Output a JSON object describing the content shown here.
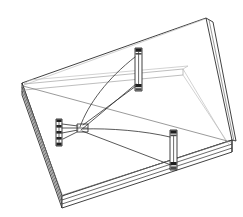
{
  "figure": {
    "title": "Isometric wireframe line drawing of a rectangular base plate with three vertical posts and connecting strings",
    "type": "technical-line-drawing",
    "background_color": "#ffffff",
    "canvas": {
      "width": 243,
      "height": 217
    },
    "colors": {
      "outline_dark": "#2b2b2b",
      "outline_mid": "#6e6e6e",
      "outline_light": "#9a9a9a",
      "outline_faint": "#b4b4b4",
      "post_fill": "#ffffff",
      "post_band": "#1f1f1f",
      "face_fill": "#ffffff"
    },
    "parts": [
      {
        "name": "base-plate",
        "label": "Base plate",
        "description": "Large tilted rectangular slab drawn in perspective with visible edge thickness along the left and bottom sides",
        "corners": {
          "left": [
            22,
            83
          ],
          "top": [
            206,
            18
          ],
          "right": [
            232,
            140
          ],
          "bottom": [
            62,
            196
          ]
        },
        "thickness_px": 12
      },
      {
        "name": "inner-frame",
        "label": "Inner frame rail",
        "description": "Lighter secondary rail offset inside the plate running from the left corner to the right corner",
        "stroke_color": "#9a9a9a"
      },
      {
        "name": "post-top",
        "label": "Upper post",
        "description": "Vertical cylindrical post with dark banding near top and bottom",
        "position": [
          138,
          50
        ],
        "height_px": 42
      },
      {
        "name": "post-left",
        "label": "Left post",
        "description": "Vertical cylindrical post with four dark bands",
        "position": [
          59,
          122
        ],
        "height_px": 26
      },
      {
        "name": "post-right",
        "label": "Right post",
        "description": "Vertical cylindrical post with dark banding near top and bottom",
        "position": [
          174,
          133
        ],
        "height_px": 40
      },
      {
        "name": "junction-clip",
        "label": "Center junction clip",
        "description": "Small rectangular clip block where the strings converge",
        "position": [
          82,
          127
        ]
      },
      {
        "name": "string-set",
        "label": "Strings",
        "description": "Curved and straight lines connecting the junction clip to each of the three posts",
        "count": 6
      }
    ]
  }
}
